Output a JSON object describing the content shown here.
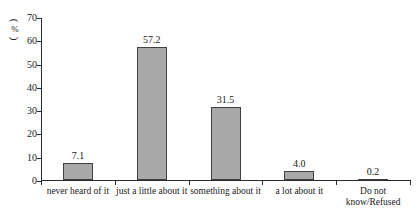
{
  "chart_data": {
    "type": "bar",
    "title": "",
    "xlabel": "",
    "ylabel": "",
    "unit_label": "%",
    "unit_label_display": "（%）",
    "categories": [
      "never heard of it",
      "just a little about it",
      "something about it",
      "a lot about it",
      "Do not\nknow/Refused"
    ],
    "values": [
      7.1,
      57.2,
      31.5,
      4.0,
      0.2
    ],
    "value_labels": [
      "7.1",
      "57.2",
      "31.5",
      "4.0",
      "0.2"
    ],
    "ylim": [
      0,
      70
    ],
    "yticks": [
      0,
      10,
      20,
      30,
      40,
      50,
      60,
      70
    ],
    "ytick_labels": [
      "0",
      "10",
      "20",
      "30",
      "40",
      "50",
      "60",
      "70"
    ],
    "grid": false,
    "legend": false,
    "legend_position": "none",
    "bar_color": "#a9a9a9",
    "bar_border_color": "#404040",
    "axis_color": "#2a2a2a",
    "text_color": "#1a1a1a",
    "background": "#ffffff"
  }
}
